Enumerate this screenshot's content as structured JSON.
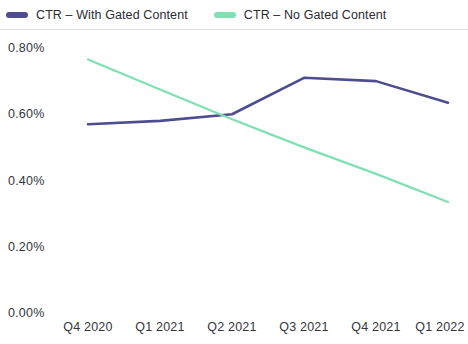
{
  "legend": {
    "position": "top-left",
    "entries": [
      {
        "label": "CTR – With Gated Content",
        "color": "#4d4d8f",
        "swatch_name": "legend-swatch-gated"
      },
      {
        "label": "CTR – No Gated Content",
        "color": "#7fe0b2",
        "swatch_name": "legend-swatch-nogated"
      }
    ]
  },
  "chart_data": {
    "type": "line",
    "title": "",
    "subtitle": "",
    "xlabel": "",
    "ylabel": "",
    "categories": [
      "Q4 2020",
      "Q1 2021",
      "Q2 2021",
      "Q3 2021",
      "Q4 2021",
      "Q1 2022"
    ],
    "ytick_labels": [
      "0.80%",
      "0.60%",
      "0.40%",
      "0.20%",
      "0.00%"
    ],
    "ytick_values": [
      0.8,
      0.6,
      0.4,
      0.2,
      0.0
    ],
    "ylim": [
      0.0,
      0.8
    ],
    "grid": false,
    "legend_position": "top-left",
    "series": [
      {
        "name": "CTR – With Gated Content",
        "color": "#4d4d8f",
        "values": [
          0.57,
          0.58,
          0.6,
          0.71,
          0.7,
          0.635
        ]
      },
      {
        "name": "CTR – No Gated Content",
        "color": "#7fe0b2",
        "values": [
          0.765,
          0.675,
          0.585,
          0.5,
          0.42,
          0.335
        ]
      }
    ]
  }
}
